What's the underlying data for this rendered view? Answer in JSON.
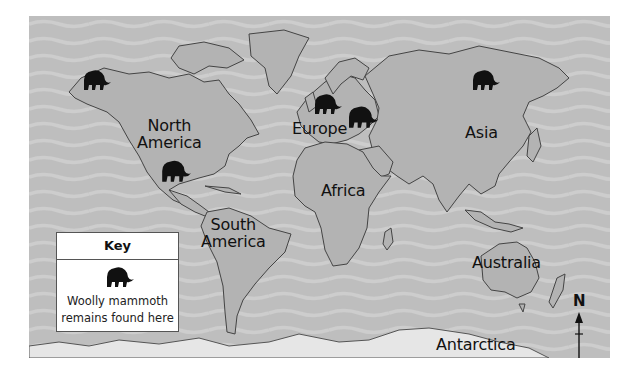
{
  "map": {
    "title": "Woolly mammoth remains world map",
    "colors": {
      "ocean": "#bebebe",
      "wave": "#cdcdcd",
      "land": "#b3b3b3",
      "outline": "#444444",
      "antarctica": "#e6e6e6",
      "mammoth": "#111111"
    },
    "labels": {
      "north_america": "North\nAmerica",
      "north_america_line1": "North",
      "north_america_line2": "America",
      "south_america_line1": "South",
      "south_america_line2": "America",
      "europe": "Europe",
      "asia": "Asia",
      "africa": "Africa",
      "australia": "Australia",
      "antarctica": "Antarctica"
    },
    "markers": [
      {
        "name": "alaska",
        "icon": "mammoth-icon"
      },
      {
        "name": "central-mexico",
        "icon": "mammoth-icon"
      },
      {
        "name": "northern-europe",
        "icon": "mammoth-icon"
      },
      {
        "name": "eastern-europe",
        "icon": "mammoth-icon"
      },
      {
        "name": "siberia",
        "icon": "mammoth-icon"
      }
    ]
  },
  "key": {
    "title": "Key",
    "icon": "mammoth-icon",
    "description_line1": "Woolly mammoth",
    "description_line2": "remains found here"
  },
  "compass": {
    "label": "N",
    "icon": "north-arrow-icon"
  }
}
